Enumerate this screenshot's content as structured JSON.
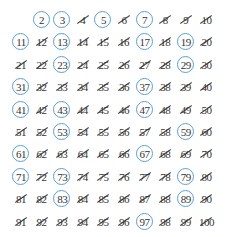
{
  "grid": {
    "rows": 10,
    "cols": 10,
    "start": 1,
    "end": 100,
    "empty_cells": [
      1
    ],
    "primes": [
      2,
      3,
      5,
      7,
      11,
      13,
      17,
      19,
      23,
      29,
      31,
      37,
      41,
      43,
      47,
      53,
      59,
      61,
      67,
      71,
      73,
      79,
      83,
      89,
      97
    ],
    "composite_style": "crossed-out",
    "prime_style": "circled"
  },
  "colors": {
    "circle": "#5b9fd2",
    "text": "#333333",
    "strike": "#444444",
    "background": "#ffffff"
  },
  "footer": {
    "text_visible": "100"
  }
}
